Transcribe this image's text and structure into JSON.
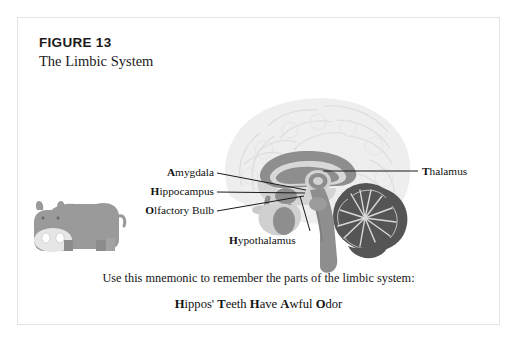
{
  "figure": {
    "number": "FIGURE 13",
    "title": "The Limbic System"
  },
  "labels": {
    "amygdala": {
      "initial": "A",
      "rest": "mygdala"
    },
    "hippocampus": {
      "initial": "H",
      "rest": "ippocampus"
    },
    "olfactory_bulb": {
      "initial": "O",
      "rest": "lfactory Bulb"
    },
    "thalamus": {
      "initial": "T",
      "rest": "halamus"
    },
    "hypothalamus": {
      "initial": "H",
      "rest": "ypothalamus"
    }
  },
  "mnemonic": {
    "sentence": "Use this mnemonic to remember the parts of the limbic system:",
    "words": [
      {
        "initial": "H",
        "rest": "ippos'"
      },
      {
        "initial": "T",
        "rest": "eeth"
      },
      {
        "initial": "H",
        "rest": "ave"
      },
      {
        "initial": "A",
        "rest": "wful"
      },
      {
        "initial": "O",
        "rest": "dor"
      }
    ]
  },
  "illustration": {
    "hippo": "hippo-illustration",
    "brain": "brain-sagittal-section"
  },
  "colors": {
    "border": "#e3e3e3",
    "text": "#111111",
    "leader_line": "#1a1a1a",
    "brain_outline": "#eeeeee",
    "brain_gyri": "#e2e2e2",
    "limbic_mid_gray": "#8e8e8e",
    "limbic_dark_gray": "#555555",
    "hippo_body": "#9a9a9a",
    "hippo_snout": "#e6e6e6"
  }
}
